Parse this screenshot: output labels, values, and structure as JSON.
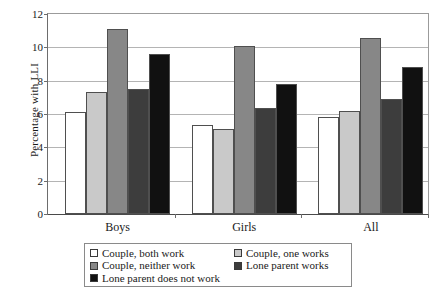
{
  "chart_data": {
    "type": "bar",
    "title": "",
    "xlabel": "",
    "ylabel": "Percentage with LLI",
    "ylim": [
      0,
      12
    ],
    "yticks": [
      0,
      2,
      4,
      6,
      8,
      10,
      12
    ],
    "ytick_labels": [
      "0",
      "2",
      "4",
      "6",
      "8",
      "10",
      "12"
    ],
    "grid": true,
    "legend_position": "below",
    "categories": [
      "Boys",
      "Girls",
      "All"
    ],
    "series": [
      {
        "name": "Couple, both work",
        "color": "#ffffff",
        "values": [
          6.15,
          5.35,
          5.85
        ]
      },
      {
        "name": "Couple, one works",
        "color": "#c9c9c9",
        "values": [
          7.3,
          5.1,
          6.2
        ]
      },
      {
        "name": "Couple, neither work",
        "color": "#878787",
        "values": [
          11.1,
          10.1,
          10.55
        ]
      },
      {
        "name": "Lone parent works",
        "color": "#3d3d3d",
        "values": [
          7.5,
          6.35,
          6.9
        ]
      },
      {
        "name": "Lone parent does not work",
        "color": "#111111",
        "values": [
          9.6,
          7.8,
          8.8
        ]
      }
    ]
  }
}
